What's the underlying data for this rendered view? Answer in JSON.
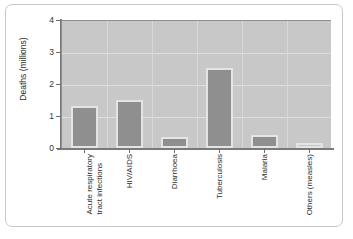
{
  "chart_data": {
    "type": "bar",
    "title": "",
    "subtitle": "",
    "xlabel": "",
    "ylabel": "Deaths (millions)",
    "categories": [
      "Acute respiratory tract infections",
      "HIV/AIDS",
      "Diarrhoea",
      "Tuberculosis",
      "Malaria",
      "Others (measles)"
    ],
    "category_lines": [
      [
        "Acute respiratory",
        "tract infections"
      ],
      [
        "HIV/AIDS",
        ""
      ],
      [
        "Diarrhoea",
        ""
      ],
      [
        "Tuberculosis",
        ""
      ],
      [
        "Malaria",
        ""
      ],
      [
        "Others (measles)",
        ""
      ]
    ],
    "values": [
      1.3,
      1.5,
      0.35,
      2.5,
      0.4,
      0.15
    ],
    "ylim": [
      0,
      4
    ],
    "ytick_labels": [
      "0",
      "1",
      "2",
      "3",
      "4"
    ],
    "ytick_values": [
      0,
      1,
      2,
      3,
      4
    ],
    "grid": true,
    "legend": "none",
    "colors": {
      "plot_background": "#c8c8c8",
      "figure_background": "#ffffff",
      "bar_fill": "#8f8f8f",
      "bar_fill_light": "#c6c6c6",
      "bar_outline": "#e4e4e4",
      "gridline": "#dedede",
      "axis_line": "#7a7a7a",
      "text": "#2c2c2c",
      "frame_border": "#c9c9c9"
    }
  }
}
